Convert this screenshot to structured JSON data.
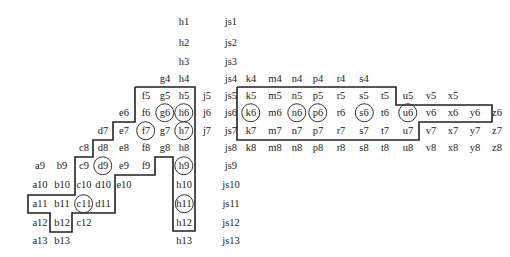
{
  "diagram": {
    "columns": {
      "a": 40,
      "b": 62,
      "c": 84,
      "d": 103,
      "e": 124,
      "f": 146,
      "g": 165,
      "h": 184,
      "j": 207,
      "js": 231,
      "k": 251,
      "m": 275,
      "n": 297,
      "p": 318,
      "r": 341,
      "s": 364,
      "t": 385,
      "u": 408,
      "v": 431,
      "x": 453,
      "y": 475,
      "z": 497
    },
    "rows": {
      "1": 22,
      "2": 43,
      "3": 62,
      "4": 79,
      "5": 96,
      "6": 113,
      "7": 131,
      "8": 148,
      "9": 166,
      "10": 185,
      "11": 204,
      "12": 223,
      "13": 241
    },
    "cells": [
      {
        "label": "h1",
        "col": "h",
        "row": "1"
      },
      {
        "label": "js1",
        "col": "js",
        "row": "1"
      },
      {
        "label": "h2",
        "col": "h",
        "row": "2"
      },
      {
        "label": "js2",
        "col": "js",
        "row": "2"
      },
      {
        "label": "h3",
        "col": "h",
        "row": "3"
      },
      {
        "label": "js3",
        "col": "js",
        "row": "3"
      },
      {
        "label": "g4",
        "col": "g",
        "row": "4"
      },
      {
        "label": "h4",
        "col": "h",
        "row": "4"
      },
      {
        "label": "js4",
        "col": "js",
        "row": "4"
      },
      {
        "label": "k4",
        "col": "k",
        "row": "4"
      },
      {
        "label": "m4",
        "col": "m",
        "row": "4"
      },
      {
        "label": "n4",
        "col": "n",
        "row": "4"
      },
      {
        "label": "p4",
        "col": "p",
        "row": "4"
      },
      {
        "label": "r4",
        "col": "r",
        "row": "4"
      },
      {
        "label": "s4",
        "col": "s",
        "row": "4"
      },
      {
        "label": "f5",
        "col": "f",
        "row": "5"
      },
      {
        "label": "g5",
        "col": "g",
        "row": "5"
      },
      {
        "label": "h5",
        "col": "h",
        "row": "5"
      },
      {
        "label": "j5",
        "col": "j",
        "row": "5"
      },
      {
        "label": "js5",
        "col": "js",
        "row": "5"
      },
      {
        "label": "k5",
        "col": "k",
        "row": "5"
      },
      {
        "label": "m5",
        "col": "m",
        "row": "5"
      },
      {
        "label": "n5",
        "col": "n",
        "row": "5"
      },
      {
        "label": "p5",
        "col": "p",
        "row": "5"
      },
      {
        "label": "r5",
        "col": "r",
        "row": "5"
      },
      {
        "label": "s5",
        "col": "s",
        "row": "5"
      },
      {
        "label": "t5",
        "col": "t",
        "row": "5"
      },
      {
        "label": "u5",
        "col": "u",
        "row": "5"
      },
      {
        "label": "v5",
        "col": "v",
        "row": "5"
      },
      {
        "label": "x5",
        "col": "x",
        "row": "5"
      },
      {
        "label": "e6",
        "col": "e",
        "row": "6"
      },
      {
        "label": "f6",
        "col": "f",
        "row": "6"
      },
      {
        "label": "g6",
        "col": "g",
        "row": "6",
        "circled": true
      },
      {
        "label": "h6",
        "col": "h",
        "row": "6",
        "circled": true
      },
      {
        "label": "j6",
        "col": "j",
        "row": "6"
      },
      {
        "label": "js6",
        "col": "js",
        "row": "6"
      },
      {
        "label": "k6",
        "col": "k",
        "row": "6",
        "circled": true
      },
      {
        "label": "m6",
        "col": "m",
        "row": "6"
      },
      {
        "label": "n6",
        "col": "n",
        "row": "6",
        "circled": true
      },
      {
        "label": "p6",
        "col": "p",
        "row": "6",
        "circled": true
      },
      {
        "label": "r6",
        "col": "r",
        "row": "6"
      },
      {
        "label": "s6",
        "col": "s",
        "row": "6",
        "circled": true
      },
      {
        "label": "t6",
        "col": "t",
        "row": "6"
      },
      {
        "label": "u6",
        "col": "u",
        "row": "6",
        "circled": true
      },
      {
        "label": "v6",
        "col": "v",
        "row": "6"
      },
      {
        "label": "x6",
        "col": "x",
        "row": "6"
      },
      {
        "label": "y6",
        "col": "y",
        "row": "6"
      },
      {
        "label": "z6",
        "col": "z",
        "row": "6"
      },
      {
        "label": "d7",
        "col": "d",
        "row": "7"
      },
      {
        "label": "e7",
        "col": "e",
        "row": "7"
      },
      {
        "label": "f7",
        "col": "f",
        "row": "7",
        "circled": true
      },
      {
        "label": "g7",
        "col": "g",
        "row": "7"
      },
      {
        "label": "h7",
        "col": "h",
        "row": "7",
        "circled": true
      },
      {
        "label": "j7",
        "col": "j",
        "row": "7"
      },
      {
        "label": "js7",
        "col": "js",
        "row": "7"
      },
      {
        "label": "k7",
        "col": "k",
        "row": "7"
      },
      {
        "label": "m7",
        "col": "m",
        "row": "7"
      },
      {
        "label": "n7",
        "col": "n",
        "row": "7"
      },
      {
        "label": "p7",
        "col": "p",
        "row": "7"
      },
      {
        "label": "r7",
        "col": "r",
        "row": "7"
      },
      {
        "label": "s7",
        "col": "s",
        "row": "7"
      },
      {
        "label": "t7",
        "col": "t",
        "row": "7"
      },
      {
        "label": "u7",
        "col": "u",
        "row": "7"
      },
      {
        "label": "v7",
        "col": "v",
        "row": "7"
      },
      {
        "label": "x7",
        "col": "x",
        "row": "7"
      },
      {
        "label": "y7",
        "col": "y",
        "row": "7"
      },
      {
        "label": "z7",
        "col": "z",
        "row": "7"
      },
      {
        "label": "c8",
        "col": "c",
        "row": "8"
      },
      {
        "label": "d8",
        "col": "d",
        "row": "8"
      },
      {
        "label": "e8",
        "col": "e",
        "row": "8"
      },
      {
        "label": "f8",
        "col": "f",
        "row": "8"
      },
      {
        "label": "g8",
        "col": "g",
        "row": "8"
      },
      {
        "label": "h8",
        "col": "h",
        "row": "8"
      },
      {
        "label": "js8",
        "col": "js",
        "row": "8"
      },
      {
        "label": "k8",
        "col": "k",
        "row": "8"
      },
      {
        "label": "m8",
        "col": "m",
        "row": "8"
      },
      {
        "label": "n8",
        "col": "n",
        "row": "8"
      },
      {
        "label": "p8",
        "col": "p",
        "row": "8"
      },
      {
        "label": "r8",
        "col": "r",
        "row": "8"
      },
      {
        "label": "s8",
        "col": "s",
        "row": "8"
      },
      {
        "label": "t8",
        "col": "t",
        "row": "8"
      },
      {
        "label": "u8",
        "col": "u",
        "row": "8"
      },
      {
        "label": "v8",
        "col": "v",
        "row": "8"
      },
      {
        "label": "x8",
        "col": "x",
        "row": "8"
      },
      {
        "label": "y8",
        "col": "y",
        "row": "8"
      },
      {
        "label": "z8",
        "col": "z",
        "row": "8"
      },
      {
        "label": "a9",
        "col": "a",
        "row": "9"
      },
      {
        "label": "b9",
        "col": "b",
        "row": "9"
      },
      {
        "label": "c9",
        "col": "c",
        "row": "9"
      },
      {
        "label": "d9",
        "col": "d",
        "row": "9",
        "circled": true
      },
      {
        "label": "e9",
        "col": "e",
        "row": "9"
      },
      {
        "label": "f9",
        "col": "f",
        "row": "9"
      },
      {
        "label": "h9",
        "col": "h",
        "row": "9",
        "circled": true
      },
      {
        "label": "js9",
        "col": "js",
        "row": "9"
      },
      {
        "label": "a10",
        "col": "a",
        "row": "10"
      },
      {
        "label": "b10",
        "col": "b",
        "row": "10"
      },
      {
        "label": "c10",
        "col": "c",
        "row": "10"
      },
      {
        "label": "d10",
        "col": "d",
        "row": "10"
      },
      {
        "label": "e10",
        "col": "e",
        "row": "10"
      },
      {
        "label": "h10",
        "col": "h",
        "row": "10"
      },
      {
        "label": "js10",
        "col": "js",
        "row": "10"
      },
      {
        "label": "a11",
        "col": "a",
        "row": "11"
      },
      {
        "label": "b11",
        "col": "b",
        "row": "11"
      },
      {
        "label": "c11",
        "col": "c",
        "row": "11",
        "circled": true
      },
      {
        "label": "d11",
        "col": "d",
        "row": "11"
      },
      {
        "label": "h11",
        "col": "h",
        "row": "11",
        "circled": true
      },
      {
        "label": "js11",
        "col": "js",
        "row": "11"
      },
      {
        "label": "a12",
        "col": "a",
        "row": "12"
      },
      {
        "label": "b12",
        "col": "b",
        "row": "12"
      },
      {
        "label": "c12",
        "col": "c",
        "row": "12"
      },
      {
        "label": "h12",
        "col": "h",
        "row": "12"
      },
      {
        "label": "js12",
        "col": "js",
        "row": "12"
      },
      {
        "label": "a13",
        "col": "a",
        "row": "13"
      },
      {
        "label": "b13",
        "col": "b",
        "row": "13"
      },
      {
        "label": "h13",
        "col": "h",
        "row": "13"
      },
      {
        "label": "js13",
        "col": "js",
        "row": "13"
      }
    ],
    "boundaries": [
      {
        "name": "left-region-boundary",
        "points": "135,87 195,87 195,231 173,231 173,157 155,157 155,175 135,175 135,175 115,175 115,213 72,213 72,232 50,232 50,213 28,213 28,195 75,195 75,157 93,157 93,140 113,140 113,122 135,122 135,87"
      },
      {
        "name": "right-region-boundary",
        "points": "237,87 396,87 396,105 492,105 492,122 419,122 419,140 237,140 237,87"
      }
    ],
    "line_color": "#222222",
    "text_color": "#222222"
  }
}
